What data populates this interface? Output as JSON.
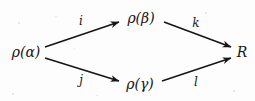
{
  "figure": {
    "kind": "commutative-diagram",
    "shape": "diamond",
    "background_color": "#fdfdfd",
    "ink_color": "#161616"
  },
  "nodes": [
    {
      "id": "rho-alpha",
      "label": "ρ(α)",
      "position": "left",
      "x": 26,
      "y": 52
    },
    {
      "id": "rho-beta",
      "label": "ρ(β)",
      "position": "top",
      "x": 141,
      "y": 18
    },
    {
      "id": "rho-gamma",
      "label": "ρ(γ)",
      "position": "bottom",
      "x": 140,
      "y": 84
    },
    {
      "id": "r",
      "label": "R",
      "position": "right",
      "x": 242,
      "y": 52
    }
  ],
  "arrows": [
    {
      "id": "alpha-to-beta",
      "label": "i",
      "from": "rho-alpha",
      "to": "rho-beta",
      "label_x": 81,
      "label_y": 21,
      "x1": 45,
      "y1": 47,
      "x2": 119,
      "y2": 22
    },
    {
      "id": "beta-to-r",
      "label": "k",
      "from": "rho-beta",
      "to": "r",
      "label_x": 196,
      "label_y": 23,
      "x1": 164,
      "y1": 22,
      "x2": 231,
      "y2": 47
    },
    {
      "id": "alpha-to-gamma",
      "label": "j",
      "from": "rho-alpha",
      "to": "rho-gamma",
      "label_x": 81,
      "label_y": 80,
      "x1": 45,
      "y1": 58,
      "x2": 119,
      "y2": 81
    },
    {
      "id": "gamma-to-r",
      "label": "l",
      "from": "rho-gamma",
      "to": "r",
      "label_x": 196,
      "label_y": 82,
      "x1": 162,
      "y1": 81,
      "x2": 231,
      "y2": 58
    }
  ]
}
